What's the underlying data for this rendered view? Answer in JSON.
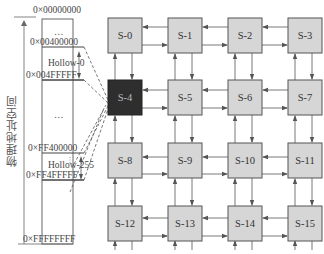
{
  "memory": {
    "axis_label": "物理地址空间",
    "addresses": {
      "top": "0×00000000",
      "hollow0_start": "0×00400000",
      "hollow0_end": "0×004FFFFF",
      "hollow255_start": "0×FF400000",
      "hollow255_end": "0×FF4FFFFF",
      "bottom": "0×FFFFFFFF"
    },
    "regions": {
      "hollow0": "Hollow-0",
      "hollow255": "Hollow-255",
      "ellipsis": "…"
    }
  },
  "mesh": {
    "rows": 4,
    "cols": 4,
    "highlighted": "S-4",
    "nodes": [
      {
        "label": "S-0"
      },
      {
        "label": "S-1"
      },
      {
        "label": "S-2"
      },
      {
        "label": "S-3"
      },
      {
        "label": "S-4"
      },
      {
        "label": "S-5"
      },
      {
        "label": "S-6"
      },
      {
        "label": "S-7"
      },
      {
        "label": "S-8"
      },
      {
        "label": "S-9"
      },
      {
        "label": "S-10"
      },
      {
        "label": "S-11"
      },
      {
        "label": "S-12"
      },
      {
        "label": "S-13"
      },
      {
        "label": "S-14"
      },
      {
        "label": "S-15"
      }
    ]
  },
  "colors": {
    "node_fill": "#d6d6d6",
    "node_highlight": "#2e2e2e",
    "line": "#555555"
  }
}
